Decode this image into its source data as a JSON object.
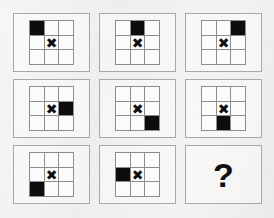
{
  "puzzle": {
    "type": "matrix-reasoning",
    "rows": 3,
    "columns": 3,
    "grid_size": 3,
    "marker_glyph": "✖",
    "marker_name": "x-mark",
    "marker_position": {
      "row": 1,
      "col": 1
    },
    "filled_color": "#0d0d0d",
    "panel_border_color": "#a8a8a6",
    "cell_border_color": "#8d8d8b",
    "background_color": "#f2f2f0",
    "answer_placeholder": "?",
    "panels": [
      {
        "index": 1,
        "name": "panel-1",
        "is_answer": false,
        "filled": {
          "row": 0,
          "col": 2
        },
        "filled_label": "top-left",
        "cells": [
          [
            true,
            false,
            false
          ],
          [
            false,
            false,
            false
          ],
          [
            false,
            false,
            false
          ]
        ]
      },
      {
        "index": 2,
        "name": "panel-2",
        "is_answer": false,
        "filled": {
          "row": 0,
          "col": 1
        },
        "filled_label": "top-center",
        "cells": [
          [
            false,
            true,
            false
          ],
          [
            false,
            false,
            false
          ],
          [
            false,
            false,
            false
          ]
        ]
      },
      {
        "index": 3,
        "name": "panel-3",
        "is_answer": false,
        "filled": {
          "row": 0,
          "col": 2
        },
        "filled_label": "top-right",
        "cells": [
          [
            false,
            false,
            true
          ],
          [
            false,
            false,
            false
          ],
          [
            false,
            false,
            false
          ]
        ]
      },
      {
        "index": 4,
        "name": "panel-4",
        "is_answer": false,
        "filled": {
          "row": 1,
          "col": 2
        },
        "filled_label": "middle-right",
        "cells": [
          [
            false,
            false,
            false
          ],
          [
            false,
            false,
            true
          ],
          [
            false,
            false,
            false
          ]
        ]
      },
      {
        "index": 5,
        "name": "panel-5",
        "is_answer": false,
        "filled": {
          "row": 2,
          "col": 2
        },
        "filled_label": "bottom-right",
        "cells": [
          [
            false,
            false,
            false
          ],
          [
            false,
            false,
            false
          ],
          [
            false,
            false,
            true
          ]
        ]
      },
      {
        "index": 6,
        "name": "panel-6",
        "is_answer": false,
        "filled": {
          "row": 2,
          "col": 1
        },
        "filled_label": "bottom-center",
        "cells": [
          [
            false,
            false,
            false
          ],
          [
            false,
            false,
            false
          ],
          [
            false,
            true,
            false
          ]
        ]
      },
      {
        "index": 7,
        "name": "panel-7",
        "is_answer": false,
        "filled": {
          "row": 2,
          "col": 0
        },
        "filled_label": "bottom-left",
        "cells": [
          [
            false,
            false,
            false
          ],
          [
            false,
            false,
            false
          ],
          [
            true,
            false,
            false
          ]
        ]
      },
      {
        "index": 8,
        "name": "panel-8",
        "is_answer": false,
        "filled": {
          "row": 1,
          "col": 0
        },
        "filled_label": "middle-left",
        "cells": [
          [
            false,
            false,
            false
          ],
          [
            true,
            false,
            false
          ],
          [
            false,
            false,
            false
          ]
        ]
      },
      {
        "index": 9,
        "name": "panel-9-answer",
        "is_answer": true,
        "filled": null,
        "filled_label": "unknown",
        "cells": null
      }
    ]
  }
}
